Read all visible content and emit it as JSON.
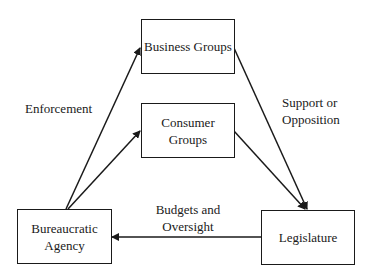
{
  "diagram": {
    "nodes": {
      "business": {
        "line1": "Business Groups",
        "line2": ""
      },
      "consumer": {
        "line1": "Consumer",
        "line2": "Groups"
      },
      "agency": {
        "line1": "Bureaucratic",
        "line2": "Agency"
      },
      "legislature": {
        "line1": "Legislature",
        "line2": ""
      }
    },
    "edge_labels": {
      "enforcement": {
        "line1": "Enforcement"
      },
      "support": {
        "line1": "Support or",
        "line2": "Opposition"
      },
      "budgets": {
        "line1": "Budgets and",
        "line2": "Oversight"
      }
    },
    "edges": [
      {
        "from": "Bureaucratic Agency",
        "to": "Business Groups",
        "label": "Enforcement"
      },
      {
        "from": "Bureaucratic Agency",
        "to": "Consumer Groups",
        "label": "Enforcement"
      },
      {
        "from": "Business Groups",
        "to": "Legislature",
        "label": "Support or Opposition"
      },
      {
        "from": "Consumer Groups",
        "to": "Legislature",
        "label": "Support or Opposition"
      },
      {
        "from": "Legislature",
        "to": "Bureaucratic Agency",
        "label": "Budgets and Oversight"
      }
    ]
  }
}
